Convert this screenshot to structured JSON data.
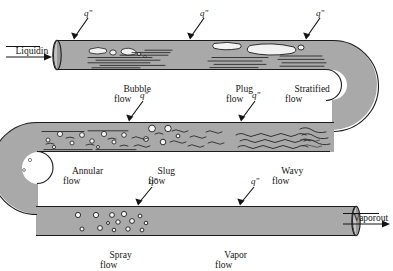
{
  "figure": {
    "type": "two-phase-flow-regime-diagram",
    "background_color": "#ffffff",
    "tube_fill_color": "#a9a9a9",
    "tube_outline_color": "#1c1c1c",
    "ink_color": "#141414"
  },
  "inlet": {
    "line1": "Liquid",
    "line2": "in"
  },
  "outlet": {
    "line1": "Vapor",
    "line2": "out"
  },
  "heat_flux": {
    "symbol": "q″",
    "count": 8,
    "arrows": [
      {
        "id": "flux-1",
        "label": "q″",
        "row": "top"
      },
      {
        "id": "flux-2",
        "label": "q″",
        "row": "top"
      },
      {
        "id": "flux-3",
        "label": "q″",
        "row": "top"
      },
      {
        "id": "flux-4",
        "label": "q″",
        "row": "middle"
      },
      {
        "id": "flux-5",
        "label": "q″",
        "row": "middle"
      },
      {
        "id": "flux-6",
        "label": "q″",
        "row": "bottom"
      },
      {
        "id": "flux-7",
        "label": "q″",
        "row": "bottom"
      }
    ]
  },
  "regimes": {
    "rows": [
      {
        "row": "top",
        "items": [
          {
            "id": "bubble-flow",
            "line1": "Bubble",
            "line2": "flow"
          },
          {
            "id": "plug-flow",
            "line1": "Plug",
            "line2": "flow"
          },
          {
            "id": "stratified-flow",
            "line1": "Stratified",
            "line2": "flow"
          }
        ]
      },
      {
        "row": "middle",
        "items": [
          {
            "id": "annular-flow",
            "line1": "Annular",
            "line2": "flow"
          },
          {
            "id": "slug-flow",
            "line1": "Slug",
            "line2": "flow"
          },
          {
            "id": "wavy-flow",
            "line1": "Wavy",
            "line2": "flow"
          }
        ]
      },
      {
        "row": "bottom",
        "items": [
          {
            "id": "spray-flow",
            "line1": "Spray",
            "line2": "flow"
          },
          {
            "id": "vapor-flow",
            "line1": "Vapor",
            "line2": "flow"
          }
        ]
      }
    ]
  }
}
